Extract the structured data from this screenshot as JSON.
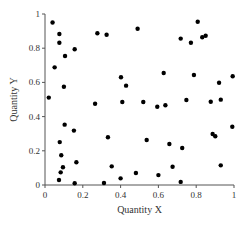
{
  "chart_data": {
    "type": "scatter",
    "title": "",
    "xlabel": "Quantity X",
    "ylabel": "Quantity Y",
    "xlim": [
      0,
      1
    ],
    "ylim": [
      0,
      1
    ],
    "grid": false,
    "legend": null,
    "x_ticks": [
      0,
      0.2,
      0.4,
      0.6,
      0.8,
      1
    ],
    "x_tick_labels": [
      "0",
      "0.2",
      "0.4",
      "0.6",
      "0.8",
      "1"
    ],
    "y_ticks": [
      0,
      0.2,
      0.4,
      0.6,
      0.8,
      1
    ],
    "y_tick_labels": [
      "0",
      "0.2",
      "0.4",
      "0.6",
      "0.8",
      "1"
    ],
    "marker_color": "#000000",
    "series": [
      {
        "name": "points",
        "points": [
          [
            0.04,
            0.95
          ],
          [
            0.076,
            0.883
          ],
          [
            0.076,
            0.832
          ],
          [
            0.106,
            0.754
          ],
          [
            0.157,
            0.794
          ],
          [
            0.277,
            0.887
          ],
          [
            0.326,
            0.879
          ],
          [
            0.051,
            0.688
          ],
          [
            0.1,
            0.575
          ],
          [
            0.02,
            0.511
          ],
          [
            0.265,
            0.475
          ],
          [
            0.104,
            0.353
          ],
          [
            0.153,
            0.318
          ],
          [
            0.333,
            0.279
          ],
          [
            0.078,
            0.251
          ],
          [
            0.086,
            0.174
          ],
          [
            0.166,
            0.133
          ],
          [
            0.095,
            0.104
          ],
          [
            0.083,
            0.074
          ],
          [
            0.074,
            0.029
          ],
          [
            0.157,
            0.01
          ],
          [
            0.312,
            0.012
          ],
          [
            0.538,
            0.263
          ],
          [
            0.658,
            0.24
          ],
          [
            0.353,
            0.109
          ],
          [
            0.481,
            0.07
          ],
          [
            0.4,
            0.039
          ],
          [
            0.6,
            0.058
          ],
          [
            0.675,
            0.107
          ],
          [
            0.991,
            0.341
          ],
          [
            0.887,
            0.298
          ],
          [
            0.901,
            0.285
          ],
          [
            0.726,
            0.216
          ],
          [
            0.93,
            0.115
          ],
          [
            0.718,
            0.018
          ],
          [
            0.402,
            0.63
          ],
          [
            0.429,
            0.581
          ],
          [
            0.628,
            0.655
          ],
          [
            0.409,
            0.485
          ],
          [
            0.52,
            0.485
          ],
          [
            0.594,
            0.458
          ],
          [
            0.637,
            0.466
          ],
          [
            0.49,
            0.914
          ],
          [
            0.808,
            0.955
          ],
          [
            0.718,
            0.856
          ],
          [
            0.772,
            0.832
          ],
          [
            0.832,
            0.864
          ],
          [
            0.85,
            0.873
          ],
          [
            0.788,
            0.643
          ],
          [
            0.921,
            0.598
          ],
          [
            0.993,
            0.636
          ],
          [
            0.748,
            0.497
          ],
          [
            0.877,
            0.487
          ],
          [
            0.93,
            0.499
          ]
        ]
      }
    ]
  }
}
